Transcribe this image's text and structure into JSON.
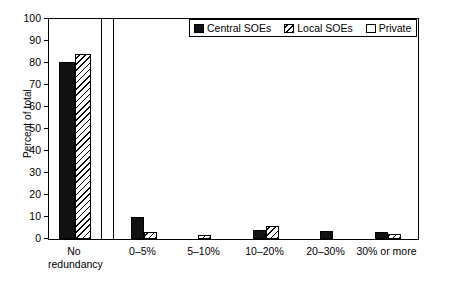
{
  "chart_data": {
    "type": "bar",
    "title": "",
    "subtitle": "",
    "xlabel": "",
    "ylabel": "Percent of total",
    "ylim": [
      0,
      100
    ],
    "ytick_step": 10,
    "yticks": [
      0,
      10,
      20,
      30,
      40,
      50,
      60,
      70,
      80,
      90,
      100
    ],
    "ytick_labels": [
      "0",
      "10",
      "20",
      "30",
      "40",
      "50",
      "60",
      "70",
      "80",
      "90",
      "100"
    ],
    "grid": false,
    "legend_position": "top-right",
    "axis_break_after_category": 0,
    "categories": [
      "No redundancy",
      "0–5%",
      "5–10%",
      "10–20%",
      "20–30%",
      "30% or more"
    ],
    "category_labels": [
      "No\nredundancy",
      "0–5%",
      "5–10%",
      "10–20%",
      "20–30%",
      "30% or more"
    ],
    "series": [
      {
        "name": "Central SOEs",
        "fill": "solid-black",
        "color": "#111111",
        "values": [
          80.5,
          10.0,
          0,
          4.0,
          3.7,
          3.0
        ]
      },
      {
        "name": "Local SOEs",
        "fill": "diagonal-hatch",
        "color": "#ffffff",
        "values": [
          84.0,
          3.2,
          2.0,
          6.0,
          0,
          2.4
        ]
      },
      {
        "name": "Private",
        "fill": "empty-white",
        "color": "#ffffff",
        "values": [
          0,
          0,
          0,
          0,
          0,
          0
        ]
      }
    ]
  },
  "legend": {
    "items": [
      {
        "label": "Central SOEs",
        "swatch": "solid-black"
      },
      {
        "label": "Local SOEs",
        "swatch": "diagonal-hatch"
      },
      {
        "label": "Private",
        "swatch": "empty-white"
      }
    ]
  },
  "colors": {
    "axis": "#000000",
    "background": "#ffffff",
    "central_soes": "#111111",
    "hatch_stroke": "#000000"
  }
}
